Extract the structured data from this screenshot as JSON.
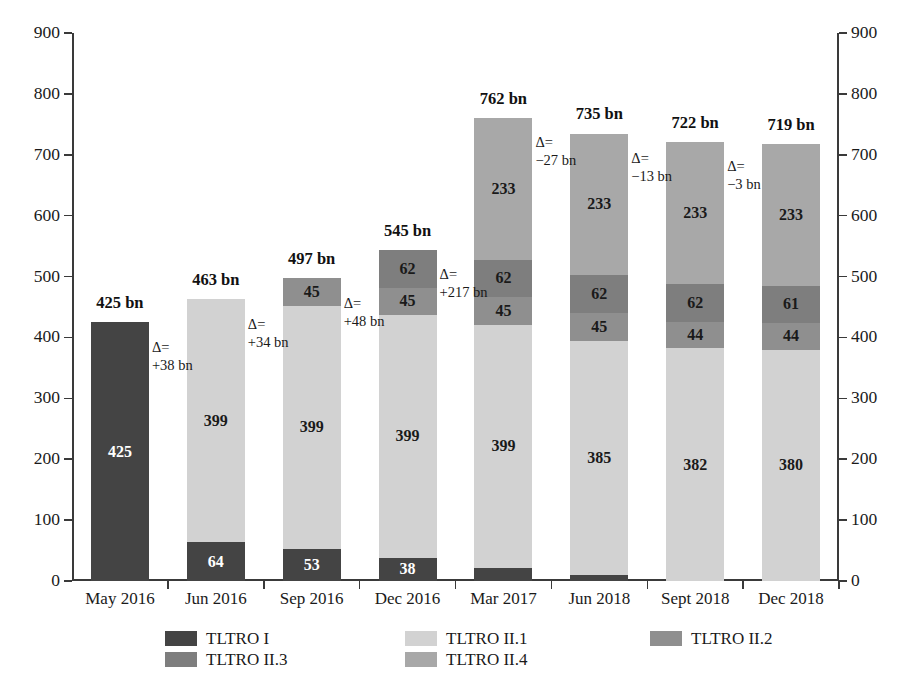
{
  "chart_data": {
    "type": "bar",
    "subtype": "stacked",
    "title": "",
    "xlabel": "",
    "ylabel": "",
    "ylim": [
      0,
      900
    ],
    "ytick_step": 100,
    "yticks": [
      0,
      100,
      200,
      300,
      400,
      500,
      600,
      700,
      800,
      900
    ],
    "grid": false,
    "legend_position": "bottom",
    "dual_y_axis": true,
    "units": "bn",
    "categories": [
      "May 2016",
      "Jun 2016",
      "Sep 2016",
      "Dec 2016",
      "Mar 2017",
      "Jun 2018",
      "Sept 2018",
      "Dec 2018"
    ],
    "series": [
      {
        "name": "TLTRO I",
        "color": "#444444",
        "values": [
          425,
          64,
          53,
          38,
          22,
          10,
          0,
          0
        ]
      },
      {
        "name": "TLTRO II.1",
        "color": "#d2d2d2",
        "values": [
          0,
          399,
          399,
          399,
          399,
          385,
          382,
          380
        ]
      },
      {
        "name": "TLTRO II.2",
        "color": "#8f8f8f",
        "values": [
          0,
          0,
          45,
          45,
          45,
          45,
          44,
          44
        ]
      },
      {
        "name": "TLTRO II.3",
        "color": "#7e7e7e",
        "values": [
          0,
          0,
          0,
          62,
          62,
          62,
          62,
          61
        ]
      },
      {
        "name": "TLTRO II.4",
        "color": "#a8a8a8",
        "values": [
          0,
          0,
          0,
          0,
          233,
          233,
          233,
          233
        ]
      }
    ],
    "totals": [
      425,
      463,
      497,
      545,
      762,
      735,
      722,
      719
    ],
    "total_labels": [
      "425 bn",
      "463 bn",
      "497 bn",
      "545 bn",
      "762 bn",
      "735 bn",
      "722 bn",
      "719 bn"
    ],
    "deltas": [
      {
        "line1": "Δ=",
        "line2": "+38 bn"
      },
      {
        "line1": "Δ=",
        "line2": "+34 bn"
      },
      {
        "line1": "Δ=",
        "line2": "+48 bn"
      },
      {
        "line1": "Δ=",
        "line2": "+217 bn"
      },
      {
        "line1": "Δ=",
        "line2": "−27 bn"
      },
      {
        "line1": "Δ=",
        "line2": "−13 bn"
      },
      {
        "line1": "Δ=",
        "line2": "−3 bn"
      }
    ],
    "segment_labels": [
      [
        "425"
      ],
      [
        "64",
        "399"
      ],
      [
        "53",
        "399",
        "45"
      ],
      [
        "38",
        "399",
        "45",
        "62"
      ],
      [
        "22",
        "399",
        "45",
        "62",
        "233"
      ],
      [
        "385",
        "45",
        "62",
        "233"
      ],
      [
        "382",
        "44",
        "62",
        "233"
      ],
      [
        "380",
        "44",
        "61",
        "233"
      ]
    ]
  },
  "axis": {
    "left_tick_labels": [
      "900",
      "800",
      "700",
      "600",
      "500",
      "400",
      "300",
      "200",
      "100",
      "0"
    ],
    "right_tick_labels": [
      "900",
      "800",
      "700",
      "600",
      "500",
      "400",
      "300",
      "200",
      "100",
      "0"
    ]
  },
  "legend": {
    "items": [
      {
        "label": "TLTRO I",
        "color": "#444444"
      },
      {
        "label": "TLTRO II.1",
        "color": "#d2d2d2"
      },
      {
        "label": "TLTRO II.2",
        "color": "#8f8f8f"
      },
      {
        "label": "TLTRO II.3",
        "color": "#7e7e7e"
      },
      {
        "label": "TLTRO II.4",
        "color": "#a8a8a8"
      }
    ]
  }
}
